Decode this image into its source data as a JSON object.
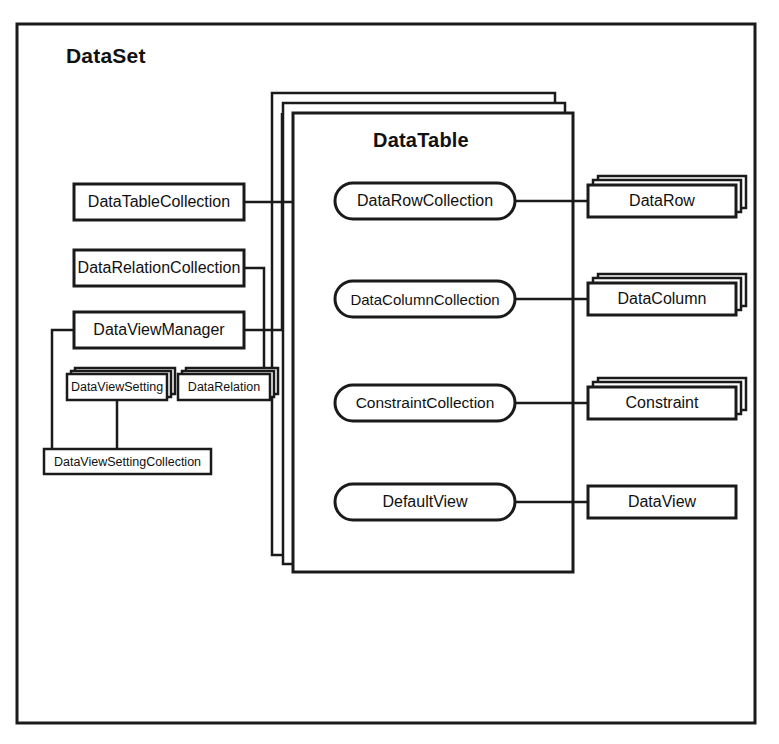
{
  "diagram": {
    "type": "object-model-diagram",
    "title": "DataSet",
    "colors": {
      "stroke": "#1a1a1a",
      "fill": "#ffffff",
      "background": "#ffffff",
      "shadow": "#2b2b2b"
    },
    "containers": [
      {
        "id": "dataset",
        "label": "DataSet",
        "shape": "rectangle",
        "x": 17,
        "y": 24,
        "w": 738,
        "h": 699
      },
      {
        "id": "datatable",
        "label": "DataTable",
        "shape": "stacked-rectangle",
        "stack_count": 3,
        "x": 293,
        "y": 113,
        "w": 280,
        "h": 459
      }
    ],
    "nodes": [
      {
        "id": "datatablecollection",
        "label": "DataTableCollection",
        "shape": "rect",
        "x": 74,
        "y": 184,
        "w": 170,
        "h": 36
      },
      {
        "id": "datarelationcollection",
        "label": "DataRelationCollection",
        "shape": "rect",
        "x": 74,
        "y": 250,
        "w": 170,
        "h": 36
      },
      {
        "id": "dataviewmanager",
        "label": "DataViewManager",
        "shape": "rect",
        "x": 74,
        "y": 312,
        "w": 170,
        "h": 36
      },
      {
        "id": "dataviewsetting",
        "label": "DataViewSetting",
        "shape": "stacked-rect",
        "stack_count": 3,
        "x": 67,
        "y": 374,
        "w": 100,
        "h": 26
      },
      {
        "id": "datarelation",
        "label": "DataRelation",
        "shape": "stacked-rect",
        "stack_count": 3,
        "x": 178,
        "y": 374,
        "w": 92,
        "h": 26
      },
      {
        "id": "dataviewsettingcollection",
        "label": "DataViewSettingCollection",
        "shape": "rect",
        "x": 44,
        "y": 449,
        "w": 167,
        "h": 25
      },
      {
        "id": "datarowcollection",
        "label": "DataRowCollection",
        "shape": "rounded",
        "x": 335,
        "y": 183,
        "w": 180,
        "h": 36
      },
      {
        "id": "datacolumncollection",
        "label": "DataColumnCollection",
        "shape": "rounded",
        "x": 335,
        "y": 281,
        "w": 180,
        "h": 36
      },
      {
        "id": "constraintcollection",
        "label": "ConstraintCollection",
        "shape": "rounded",
        "x": 335,
        "y": 385,
        "w": 180,
        "h": 36
      },
      {
        "id": "defaultview",
        "label": "DefaultView",
        "shape": "rounded",
        "x": 335,
        "y": 484,
        "w": 180,
        "h": 36
      },
      {
        "id": "datarow",
        "label": "DataRow",
        "shape": "stacked-rect",
        "stack_count": 3,
        "x": 588,
        "y": 185,
        "w": 148,
        "h": 32
      },
      {
        "id": "datacolumn",
        "label": "DataColumn",
        "shape": "stacked-rect",
        "stack_count": 3,
        "x": 588,
        "y": 283,
        "w": 148,
        "h": 32
      },
      {
        "id": "constraint",
        "label": "Constraint",
        "shape": "stacked-rect",
        "stack_count": 3,
        "x": 588,
        "y": 387,
        "w": 148,
        "h": 32
      },
      {
        "id": "dataview",
        "label": "DataView",
        "shape": "rect",
        "x": 588,
        "y": 486,
        "w": 148,
        "h": 32
      }
    ],
    "connectors": [
      {
        "id": "c-datatablecollection-datatable",
        "from": "datatablecollection",
        "to": "datatable",
        "path": "M244,202 L293,202"
      },
      {
        "id": "c-datarelationcollection-datarelation",
        "from": "datarelationcollection",
        "to": "datarelation",
        "path": "M244,268 L264,268 L264,374"
      },
      {
        "id": "c-dataviewmanager-datatable",
        "from": "dataviewmanager",
        "to": "datatable",
        "path": "M244,330 L282,330 L282,113"
      },
      {
        "id": "c-dataviewmanager-dvsc",
        "from": "dataviewmanager",
        "to": "dataviewsettingcollection",
        "path": "M74,330 L52,330 L52,449"
      },
      {
        "id": "c-dataviewsetting-dvsc",
        "from": "dataviewsetting",
        "to": "dataviewsettingcollection",
        "path": "M117,400 L117,449"
      },
      {
        "id": "c-datarowcollection-datarow",
        "from": "datarowcollection",
        "to": "datarow",
        "path": "M515,201 L588,201"
      },
      {
        "id": "c-datacolumncollection-datacolumn",
        "from": "datacolumncollection",
        "to": "datacolumn",
        "path": "M515,299 L588,299"
      },
      {
        "id": "c-constraintcollection-constraint",
        "from": "constraintcollection",
        "to": "constraint",
        "path": "M515,403 L588,403"
      },
      {
        "id": "c-defaultview-dataview",
        "from": "defaultview",
        "to": "dataview",
        "path": "M515,502 L588,502"
      }
    ]
  }
}
